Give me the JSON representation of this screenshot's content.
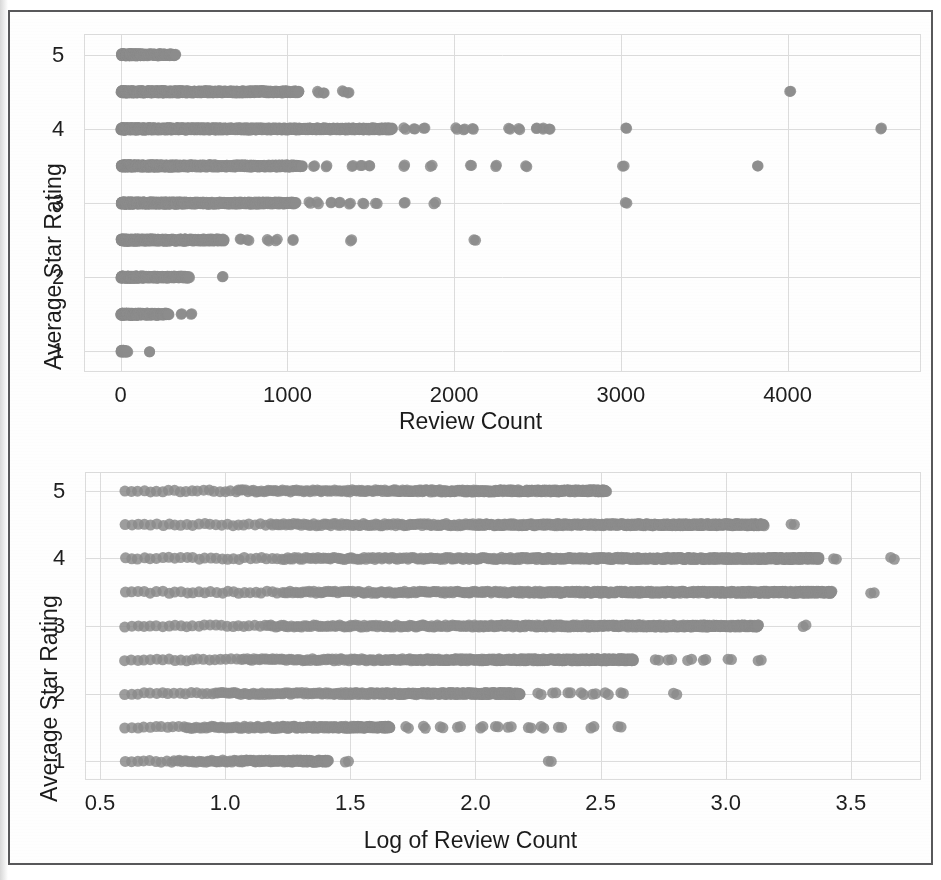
{
  "figure": {
    "frame_color": "#58585a",
    "marker_color": "#8c8c8c",
    "grid_color": "#dcdcdc",
    "background": "#ffffff"
  },
  "chart_data": [
    {
      "id": "top",
      "type": "scatter",
      "title": "",
      "xlabel": "Review Count",
      "ylabel": "Average Star Rating",
      "xlim": [
        -220,
        4800
      ],
      "ylim": [
        0.72,
        5.28
      ],
      "xticks": [
        0,
        1000,
        2000,
        3000,
        4000
      ],
      "xticklabels": [
        "0",
        "1000",
        "2000",
        "3000",
        "4000"
      ],
      "yticks": [
        1,
        2,
        3,
        4,
        5
      ],
      "yticklabels": [
        "1",
        "2",
        "3",
        "4",
        "5"
      ],
      "grid": true,
      "legend": "none",
      "marker_color": "#8c8c8c",
      "marker_size": 11,
      "rating_levels": [
        1,
        1.5,
        2,
        2.5,
        3,
        3.5,
        4,
        4.5,
        5
      ],
      "series": [
        {
          "name": "rating 5",
          "y": 5,
          "x_dense_to": 330,
          "x_outliers": []
        },
        {
          "name": "rating 4.5",
          "y": 4.5,
          "x_dense_to": 1070,
          "x_outliers": [
            1180,
            1215,
            1330,
            1365,
            4010
          ]
        },
        {
          "name": "rating 4",
          "y": 4,
          "x_dense_to": 1630,
          "x_outliers": [
            1700,
            1760,
            1820,
            2010,
            2060,
            2110,
            2330,
            2390,
            2490,
            2530,
            2570,
            3030,
            4560
          ]
        },
        {
          "name": "rating 3.5",
          "y": 3.5,
          "x_dense_to": 1090,
          "x_outliers": [
            1160,
            1230,
            1390,
            1440,
            1490,
            1700,
            1860,
            2100,
            2250,
            2430,
            3010,
            3820
          ]
        },
        {
          "name": "rating 3",
          "y": 3,
          "x_dense_to": 1050,
          "x_outliers": [
            1130,
            1180,
            1260,
            1310,
            1370,
            1450,
            1530,
            1700,
            1880,
            3030
          ]
        },
        {
          "name": "rating 2.5",
          "y": 2.5,
          "x_dense_to": 620,
          "x_outliers": [
            720,
            760,
            880,
            930,
            1030,
            1380,
            2120
          ]
        },
        {
          "name": "rating 2",
          "y": 2,
          "x_dense_to": 410,
          "x_outliers": [
            610
          ]
        },
        {
          "name": "rating 1.5",
          "y": 1.5,
          "x_dense_to": 290,
          "x_outliers": [
            360,
            420
          ]
        },
        {
          "name": "rating 1",
          "y": 1,
          "x_dense_to": 40,
          "x_outliers": [
            170
          ]
        }
      ]
    },
    {
      "id": "bottom",
      "type": "scatter",
      "title": "",
      "xlabel": "Log of Review Count",
      "ylabel": "Average Star Rating",
      "xlim": [
        0.44,
        3.78
      ],
      "ylim": [
        0.72,
        5.28
      ],
      "xticks": [
        0.5,
        1.0,
        1.5,
        2.0,
        2.5,
        3.0,
        3.5
      ],
      "xticklabels": [
        "0.5",
        "1.0",
        "1.5",
        "2.0",
        "2.5",
        "3.0",
        "3.5"
      ],
      "yticks": [
        1,
        2,
        3,
        4,
        5
      ],
      "yticklabels": [
        "1",
        "2",
        "3",
        "4",
        "5"
      ],
      "grid": true,
      "legend": "none",
      "marker_color": "#8c8c8c",
      "marker_size": 11,
      "rating_levels": [
        1,
        1.5,
        2,
        2.5,
        3,
        3.5,
        4,
        4.5,
        5
      ],
      "series": [
        {
          "name": "rating 5",
          "y": 5,
          "x_start": 0.6,
          "x_dense_to": 2.52,
          "x_outliers": []
        },
        {
          "name": "rating 4.5",
          "y": 4.5,
          "x_start": 0.6,
          "x_dense_to": 3.15,
          "x_outliers": [
            3.26
          ]
        },
        {
          "name": "rating 4",
          "y": 4,
          "x_start": 0.6,
          "x_dense_to": 3.37,
          "x_outliers": [
            3.43,
            3.66
          ]
        },
        {
          "name": "rating 3.5",
          "y": 3.5,
          "x_start": 0.6,
          "x_dense_to": 3.42,
          "x_outliers": [
            3.58
          ]
        },
        {
          "name": "rating 3",
          "y": 3,
          "x_start": 0.6,
          "x_dense_to": 3.13,
          "x_outliers": [
            3.31
          ]
        },
        {
          "name": "rating 2.5",
          "y": 2.5,
          "x_start": 0.6,
          "x_dense_to": 2.63,
          "x_outliers": [
            2.72,
            2.77,
            2.85,
            2.91,
            3.01,
            3.13
          ]
        },
        {
          "name": "rating 2",
          "y": 2,
          "x_start": 0.6,
          "x_dense_to": 2.18,
          "x_outliers": [
            2.25,
            2.31,
            2.37,
            2.42,
            2.47,
            2.52,
            2.58,
            2.79
          ]
        },
        {
          "name": "rating 1.5",
          "y": 1.5,
          "x_start": 0.6,
          "x_dense_to": 1.66,
          "x_outliers": [
            1.72,
            1.79,
            1.86,
            1.93,
            2.02,
            2.08,
            2.13,
            2.21,
            2.26,
            2.33,
            2.46,
            2.57
          ]
        },
        {
          "name": "rating 1",
          "y": 1,
          "x_start": 0.6,
          "x_dense_to": 1.41,
          "x_outliers": [
            1.48,
            2.29
          ]
        }
      ]
    }
  ]
}
